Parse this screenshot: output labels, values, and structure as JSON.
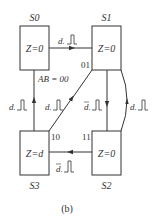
{
  "figure": {
    "caption": "(b)"
  },
  "states": [
    {
      "id": "S0",
      "name": "S0",
      "output": "Z=0",
      "code": "AB = 00"
    },
    {
      "id": "S1",
      "name": "S1",
      "output": "Z=0",
      "code": "01"
    },
    {
      "id": "S2",
      "name": "S2",
      "output": "Z=0",
      "code": "11"
    },
    {
      "id": "S3",
      "name": "S3",
      "output": "Z=d",
      "code": "10"
    }
  ],
  "transitions": [
    {
      "from": "S0",
      "to": "S1",
      "condition": "d",
      "negated": false,
      "pulse": "clock-pulse"
    },
    {
      "from": "S1",
      "to": "S2",
      "condition": "d",
      "negated": true,
      "pulse": "clock-pulse"
    },
    {
      "from": "S2",
      "to": "S1",
      "condition": "d",
      "negated": false,
      "pulse": "clock-pulse"
    },
    {
      "from": "S2",
      "to": "S3",
      "condition": "d",
      "negated": true,
      "pulse": "clock-pulse"
    },
    {
      "from": "S3",
      "to": "S0",
      "condition": "d",
      "negated": false,
      "pulse": "clock-pulse"
    },
    {
      "from": "S3",
      "to": "S1",
      "condition": "d",
      "negated": false,
      "pulse": "clock-pulse"
    }
  ],
  "colors": {
    "line": "#333333",
    "background": "#ffffff"
  }
}
